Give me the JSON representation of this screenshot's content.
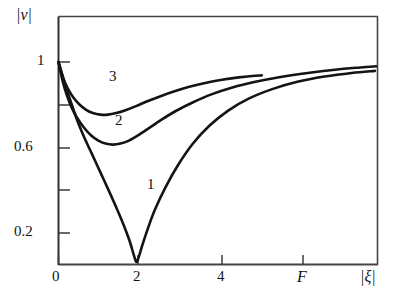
{
  "chart_data": {
    "type": "line",
    "title": "",
    "xlabel": "F",
    "ylabel": "|v|",
    "secondary_xlabel": "|ξ|",
    "xlim": [
      0,
      7.6
    ],
    "ylim": [
      0,
      1.23
    ],
    "grid": false,
    "legend": "inline-curve-numbers",
    "x_tick_values": [
      0,
      2,
      4
    ],
    "x_tick_labels": [
      "0",
      "2",
      "4"
    ],
    "x_minor_tick_values": [
      5.8
    ],
    "y_tick_values": [
      0.2,
      0.4,
      0.6,
      0.8,
      1.0
    ],
    "y_tick_labels": [
      "0.2",
      "",
      "0.6",
      "",
      "1"
    ],
    "y_labeled_ticks": [
      "1",
      "0.6",
      "0.2"
    ],
    "series": [
      {
        "name": "1",
        "label": "1",
        "color": "#141414",
        "points": [
          [
            0.0,
            1.0
          ],
          [
            0.1,
            0.93
          ],
          [
            0.2,
            0.86
          ],
          [
            0.3,
            0.8
          ],
          [
            0.45,
            0.71
          ],
          [
            0.6,
            0.635
          ],
          [
            0.8,
            0.545
          ],
          [
            1.0,
            0.455
          ],
          [
            1.2,
            0.365
          ],
          [
            1.4,
            0.272
          ],
          [
            1.55,
            0.198
          ],
          [
            1.7,
            0.115
          ],
          [
            1.8,
            0.045
          ],
          [
            1.86,
            0.012
          ],
          [
            1.92,
            0.04
          ],
          [
            2.0,
            0.095
          ],
          [
            2.12,
            0.17
          ],
          [
            2.3,
            0.27
          ],
          [
            2.55,
            0.38
          ],
          [
            2.85,
            0.49
          ],
          [
            3.2,
            0.595
          ],
          [
            3.6,
            0.685
          ],
          [
            4.05,
            0.76
          ],
          [
            4.55,
            0.82
          ],
          [
            5.1,
            0.866
          ],
          [
            5.7,
            0.902
          ],
          [
            6.35,
            0.928
          ],
          [
            7.0,
            0.946
          ],
          [
            7.55,
            0.956
          ]
        ]
      },
      {
        "name": "2",
        "label": "2",
        "color": "#141414",
        "points": [
          [
            0.0,
            1.0
          ],
          [
            0.1,
            0.905
          ],
          [
            0.2,
            0.835
          ],
          [
            0.32,
            0.772
          ],
          [
            0.45,
            0.722
          ],
          [
            0.6,
            0.678
          ],
          [
            0.78,
            0.637
          ],
          [
            0.95,
            0.612
          ],
          [
            1.12,
            0.597
          ],
          [
            1.3,
            0.592
          ],
          [
            1.48,
            0.597
          ],
          [
            1.68,
            0.612
          ],
          [
            1.9,
            0.638
          ],
          [
            2.15,
            0.672
          ],
          [
            2.45,
            0.714
          ],
          [
            2.8,
            0.758
          ],
          [
            3.2,
            0.8
          ],
          [
            3.65,
            0.84
          ],
          [
            4.15,
            0.874
          ],
          [
            4.7,
            0.902
          ],
          [
            5.3,
            0.926
          ],
          [
            5.95,
            0.946
          ],
          [
            6.6,
            0.962
          ],
          [
            7.2,
            0.973
          ],
          [
            7.58,
            0.979
          ]
        ]
      },
      {
        "name": "3",
        "label": "3",
        "color": "#141414",
        "points": [
          [
            0.0,
            1.0
          ],
          [
            0.1,
            0.928
          ],
          [
            0.22,
            0.87
          ],
          [
            0.35,
            0.826
          ],
          [
            0.5,
            0.79
          ],
          [
            0.66,
            0.764
          ],
          [
            0.82,
            0.748
          ],
          [
            1.0,
            0.74
          ],
          [
            1.18,
            0.74
          ],
          [
            1.38,
            0.748
          ],
          [
            1.6,
            0.762
          ],
          [
            1.85,
            0.782
          ],
          [
            2.12,
            0.806
          ],
          [
            2.42,
            0.83
          ],
          [
            2.75,
            0.854
          ],
          [
            3.1,
            0.876
          ],
          [
            3.5,
            0.896
          ],
          [
            3.9,
            0.912
          ],
          [
            4.3,
            0.924
          ],
          [
            4.62,
            0.931
          ],
          [
            4.85,
            0.934
          ]
        ]
      }
    ],
    "annotations": [
      {
        "text": "1",
        "x": 2.25,
        "y": 0.4
      },
      {
        "text": "2",
        "x": 1.42,
        "y": 0.715
      },
      {
        "text": "3",
        "x": 1.25,
        "y": 0.925
      }
    ]
  },
  "axes": {
    "y_title": "|v|",
    "x_title": "F",
    "x_secondary_title": "|ξ|",
    "y_ticks": [
      {
        "label": "1",
        "value": 1.0
      },
      {
        "label": "0.6",
        "value": 0.6
      },
      {
        "label": "0.2",
        "value": 0.2
      }
    ],
    "x_ticks": [
      {
        "label": "0",
        "value": 0
      },
      {
        "label": "2",
        "value": 2
      },
      {
        "label": "4",
        "value": 4
      }
    ]
  },
  "style": {
    "background": "#ffffff",
    "frame_color": "#3a3a3a",
    "curve_color": "#141414"
  }
}
